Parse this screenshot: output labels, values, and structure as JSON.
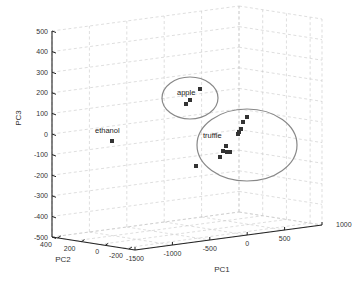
{
  "chart_data": {
    "type": "scatter3d",
    "title": "",
    "xlabel": "PC1",
    "ylabel": "PC2",
    "zlabel": "PC3",
    "x_ticks": [
      "-1500",
      "-1000",
      "-500",
      "0",
      "500",
      "1000"
    ],
    "y_ticks": [
      "-200",
      "0",
      "200",
      "400"
    ],
    "z_ticks": [
      "500",
      "400",
      "300",
      "200",
      "100",
      "0",
      "-100",
      "-200",
      "-300",
      "-400",
      "-500"
    ],
    "xlim": [
      -1500,
      1000
    ],
    "ylim": [
      -300,
      500
    ],
    "zlim": [
      -500,
      500
    ],
    "grid": true,
    "marker": "square",
    "groups": [
      {
        "name": "apple",
        "annotation": "apple",
        "encircled": true,
        "points_screen": [
          [
            200,
            89
          ],
          [
            190,
            100
          ],
          [
            186,
            104
          ]
        ]
      },
      {
        "name": "truffle",
        "annotation": "truffle",
        "encircled": true,
        "points_screen": [
          [
            247,
            117
          ],
          [
            243,
            122
          ],
          [
            241,
            129
          ],
          [
            239,
            132
          ],
          [
            238,
            134
          ],
          [
            226,
            146
          ],
          [
            223,
            151
          ],
          [
            227,
            152
          ],
          [
            230,
            152
          ],
          [
            220,
            157
          ],
          [
            196,
            166
          ]
        ]
      },
      {
        "name": "ethanol",
        "annotation": "ethanol",
        "encircled": false,
        "points_screen": [
          [
            112,
            141
          ]
        ]
      }
    ]
  },
  "labels": {
    "pc1": "PC1",
    "pc2": "PC2",
    "pc3": "PC3",
    "apple": "apple",
    "truffle": "truffle",
    "ethanol": "ethanol"
  }
}
